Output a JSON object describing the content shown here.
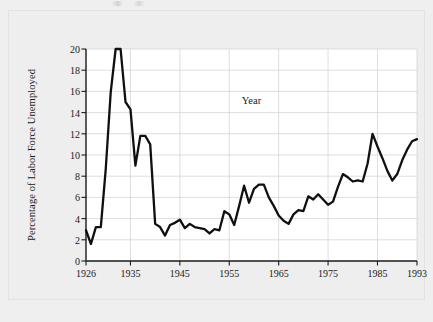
{
  "figure": {
    "background_color": "#efefef",
    "panel_color": "#eeeeee",
    "plot_background_color": "#ffffff",
    "axis_color": "#1a1a1a",
    "grid_color": "#d0d0d0",
    "line_color": "#101010"
  },
  "chart_data": {
    "type": "line",
    "title": "",
    "subtitle": "",
    "xlabel": "Year",
    "ylabel": "Percentage of Labor Force Unemployed",
    "xlim": [
      1926,
      1993
    ],
    "ylim": [
      0,
      20
    ],
    "grid": true,
    "legend": null,
    "legend_position": "none",
    "xticks": [
      1926,
      1935,
      1945,
      1955,
      1965,
      1975,
      1985,
      1993
    ],
    "xtick_labels": [
      "1926",
      "1935",
      "1945",
      "1955",
      "1965",
      "1975",
      "1985",
      "1993"
    ],
    "yticks": [
      0,
      2,
      4,
      6,
      8,
      10,
      12,
      14,
      16,
      18,
      20
    ],
    "ytick_labels": [
      "0",
      "2",
      "4",
      "6",
      "8",
      "10",
      "12",
      "14",
      "16",
      "18",
      "20"
    ],
    "series": [
      {
        "name": "Percentage of Labor Force Unemployed",
        "color": "#101010",
        "x": [
          1926,
          1927,
          1928,
          1929,
          1930,
          1931,
          1932,
          1933,
          1934,
          1935,
          1936,
          1937,
          1938,
          1939,
          1940,
          1941,
          1942,
          1943,
          1944,
          1945,
          1946,
          1947,
          1948,
          1949,
          1950,
          1951,
          1952,
          1953,
          1954,
          1955,
          1956,
          1957,
          1958,
          1959,
          1960,
          1961,
          1962,
          1963,
          1964,
          1965,
          1966,
          1967,
          1968,
          1969,
          1970,
          1971,
          1972,
          1973,
          1974,
          1975,
          1976,
          1977,
          1978,
          1979,
          1980,
          1981,
          1982,
          1983,
          1984,
          1985,
          1986,
          1987,
          1988,
          1989,
          1990,
          1991,
          1992,
          1993
        ],
        "y": [
          2.9,
          1.6,
          3.2,
          3.2,
          8.7,
          15.9,
          20.0,
          20.0,
          15.0,
          14.3,
          9.0,
          11.8,
          11.8,
          11.0,
          3.5,
          3.2,
          2.4,
          3.4,
          3.6,
          3.9,
          3.1,
          3.5,
          3.2,
          3.1,
          3.0,
          2.6,
          3.0,
          2.9,
          4.7,
          4.4,
          3.4,
          5.2,
          7.1,
          5.5,
          6.8,
          7.2,
          7.2,
          6.0,
          5.2,
          4.3,
          3.8,
          3.5,
          4.4,
          4.8,
          4.7,
          6.1,
          5.8,
          6.3,
          5.8,
          5.3,
          5.6,
          7.0,
          8.2,
          7.9,
          7.5,
          7.6,
          7.5,
          9.2,
          12.0,
          10.8,
          9.7,
          8.5,
          7.6,
          8.2,
          9.5,
          10.5,
          11.3,
          11.5
        ],
        "annotations": [
          {
            "label": "Great Depression peak",
            "x": 1933,
            "y": 20.0
          },
          {
            "label": "post-war low",
            "x": 1943,
            "y": 2.4
          },
          {
            "label": "early 1980s peak",
            "x": 1983,
            "y": 12.0
          }
        ]
      }
    ]
  }
}
